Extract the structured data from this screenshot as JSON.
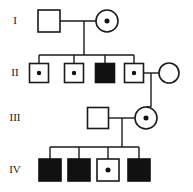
{
  "figure": {
    "width": 193,
    "height": 192,
    "background_color": "#ffffff",
    "line_color": "#1a1a1a",
    "affected_fill": "#111111",
    "unaffected_fill": "#ffffff"
  },
  "legend_semantics": {
    "square": "male",
    "circle": "female",
    "filled": "affected",
    "open": "unaffected",
    "dot": "carrier"
  },
  "generation_labels": [
    {
      "label": "I",
      "y": 21
    },
    {
      "label": "II",
      "y": 73
    },
    {
      "label": "III",
      "y": 118
    },
    {
      "label": "IV",
      "y": 170
    }
  ],
  "individuals": [
    {
      "id": "I-1",
      "generation": "I",
      "sex": "male",
      "shape": "square",
      "status": "unaffected",
      "carrier": false,
      "cx": 49,
      "cy": 21,
      "size": 22
    },
    {
      "id": "I-2",
      "generation": "I",
      "sex": "female",
      "shape": "circle",
      "status": "unaffected",
      "carrier": true,
      "cx": 107,
      "cy": 21,
      "size": 22
    },
    {
      "id": "II-1",
      "generation": "II",
      "sex": "male",
      "shape": "square",
      "status": "unaffected",
      "carrier": true,
      "cx": 39,
      "cy": 73,
      "size": 19
    },
    {
      "id": "II-2",
      "generation": "II",
      "sex": "male",
      "shape": "square",
      "status": "unaffected",
      "carrier": true,
      "cx": 74,
      "cy": 73,
      "size": 19
    },
    {
      "id": "II-3",
      "generation": "II",
      "sex": "male",
      "shape": "square",
      "status": "affected",
      "carrier": false,
      "cx": 105,
      "cy": 73,
      "size": 19
    },
    {
      "id": "II-4",
      "generation": "II",
      "sex": "male",
      "shape": "square",
      "status": "unaffected",
      "carrier": true,
      "cx": 134,
      "cy": 73,
      "size": 19
    },
    {
      "id": "II-5",
      "generation": "II",
      "sex": "female",
      "shape": "circle",
      "status": "unaffected",
      "carrier": false,
      "cx": 169,
      "cy": 73,
      "size": 20
    },
    {
      "id": "III-1",
      "generation": "III",
      "sex": "male",
      "shape": "square",
      "status": "unaffected",
      "carrier": false,
      "cx": 98,
      "cy": 118,
      "size": 21
    },
    {
      "id": "III-2",
      "generation": "III",
      "sex": "female",
      "shape": "circle",
      "status": "unaffected",
      "carrier": true,
      "cx": 146,
      "cy": 118,
      "size": 22
    },
    {
      "id": "IV-1",
      "generation": "IV",
      "sex": "male",
      "shape": "square",
      "status": "affected",
      "carrier": false,
      "cx": 50,
      "cy": 170,
      "size": 22
    },
    {
      "id": "IV-2",
      "generation": "IV",
      "sex": "male",
      "shape": "square",
      "status": "affected",
      "carrier": false,
      "cx": 79,
      "cy": 170,
      "size": 22
    },
    {
      "id": "IV-3",
      "generation": "IV",
      "sex": "male",
      "shape": "square",
      "status": "unaffected",
      "carrier": true,
      "cx": 108,
      "cy": 170,
      "size": 22
    },
    {
      "id": "IV-4",
      "generation": "IV",
      "sex": "male",
      "shape": "square",
      "status": "affected",
      "carrier": false,
      "cx": 139,
      "cy": 170,
      "size": 22
    }
  ],
  "matings": [
    {
      "id": "mating-I",
      "partners": [
        "I-1",
        "I-2"
      ],
      "line_y": 21,
      "x1": 60,
      "x2": 96,
      "drop_x": 84,
      "drop_y1": 21,
      "drop_y2": 55
    },
    {
      "id": "mating-II",
      "partners": [
        "II-4",
        "II-5"
      ],
      "line_y": 73,
      "x1": 144,
      "x2": 159,
      "drop_x": 151,
      "drop_y1": 73,
      "drop_y2": 107
    },
    {
      "id": "mating-III",
      "partners": [
        "III-1",
        "III-2"
      ],
      "line_y": 118,
      "x1": 109,
      "x2": 135,
      "drop_x": 122,
      "drop_y1": 118,
      "drop_y2": 147
    }
  ],
  "sibships": [
    {
      "id": "sibship-II",
      "parents": "mating-I",
      "bar_y": 55,
      "bar_x1": 39,
      "bar_x2": 134,
      "children": [
        {
          "ref": "II-1",
          "x": 39,
          "y2": 64
        },
        {
          "ref": "II-2",
          "x": 74,
          "y2": 64
        },
        {
          "ref": "II-3",
          "x": 105,
          "y2": 64
        },
        {
          "ref": "II-4",
          "x": 134,
          "y2": 64
        }
      ]
    },
    {
      "id": "sibship-III",
      "parents": "mating-II",
      "bar_y": 107,
      "bar_x1": 146,
      "bar_x2": 151,
      "children": [
        {
          "ref": "III-2",
          "x": 146,
          "y2": 107
        }
      ]
    },
    {
      "id": "sibship-IV",
      "parents": "mating-III",
      "bar_y": 147,
      "bar_x1": 50,
      "bar_x2": 139,
      "children": [
        {
          "ref": "IV-1",
          "x": 50,
          "y2": 159
        },
        {
          "ref": "IV-2",
          "x": 79,
          "y2": 159
        },
        {
          "ref": "IV-3",
          "x": 108,
          "y2": 159
        },
        {
          "ref": "IV-4",
          "x": 139,
          "y2": 159
        }
      ]
    }
  ]
}
